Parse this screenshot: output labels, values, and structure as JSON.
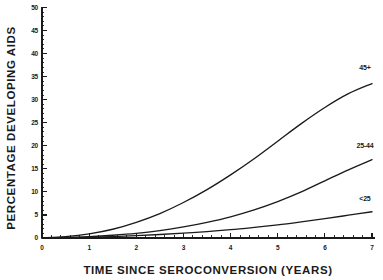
{
  "chart_data": {
    "type": "line",
    "title": "",
    "subtitle": "",
    "xlabel": "TIME SINCE SEROCONVERSION (YEARS)",
    "ylabel": "PERCENTAGE DEVELOPING AIDS",
    "xlim": [
      0,
      7
    ],
    "ylim": [
      0,
      50
    ],
    "xticks": [
      0,
      1,
      2,
      3,
      4,
      5,
      6,
      7
    ],
    "xtick_labels": [
      "0",
      "1",
      "2",
      "3",
      "4",
      "5",
      "6",
      "7"
    ],
    "x_minor_tick_interval": 0.2,
    "yticks": [
      0,
      5,
      10,
      15,
      20,
      25,
      30,
      35,
      40,
      45,
      50
    ],
    "ytick_labels": [
      "0",
      "5",
      "10",
      "15",
      "20",
      "25",
      "30",
      "35",
      "40",
      "45",
      "50"
    ],
    "y_minor_tick_interval": 1,
    "grid": false,
    "legend_position": "inline-right-end-of-curve",
    "line_color": "#1a1a1a",
    "background_color": "#ffffff",
    "x": [
      0,
      0.5,
      1,
      1.5,
      2,
      2.5,
      3,
      3.5,
      4,
      4.5,
      5,
      5.5,
      6,
      6.5,
      7
    ],
    "series": [
      {
        "name": "45+",
        "label": "45+",
        "label_x": 6.85,
        "label_y": 36.5,
        "values": [
          0,
          0.3,
          0.9,
          1.9,
          3.4,
          5.3,
          7.7,
          10.5,
          13.7,
          17.2,
          21.0,
          24.8,
          28.3,
          31.3,
          33.5
        ]
      },
      {
        "name": "25-44",
        "label": "25-44",
        "label_x": 6.85,
        "label_y": 19.5,
        "values": [
          0,
          0.1,
          0.3,
          0.6,
          1.0,
          1.6,
          2.4,
          3.4,
          4.6,
          6.1,
          7.9,
          10.0,
          12.4,
          14.8,
          17.0
        ]
      },
      {
        "name": "<25",
        "label": "<25",
        "label_x": 6.85,
        "label_y": 8.0,
        "values": [
          0,
          0.05,
          0.15,
          0.3,
          0.5,
          0.75,
          1.05,
          1.4,
          1.8,
          2.3,
          2.85,
          3.5,
          4.2,
          4.95,
          5.7
        ]
      }
    ]
  }
}
